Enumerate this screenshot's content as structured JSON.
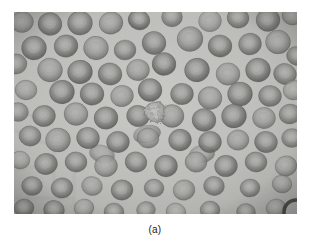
{
  "figure": {
    "caption": "(a)",
    "kind": "light-micrograph",
    "colors": {
      "page_background": "#ffffff",
      "field_background": "#b5b5b3",
      "field_background_light": "#c6c6c3",
      "field_background_dark": "#a3a3a1",
      "cell_rim": "#6d6d6b",
      "cell_rim_dark": "#4a4a48",
      "cell_center": "#9a9a98",
      "cell_center_light": "#adadaa",
      "anomalous_cell": "#b0b0ad",
      "caption_text": "#1a1a1a",
      "vignette_edge": "#8d8d8b"
    },
    "frame": {
      "x": 14,
      "y": 12,
      "width": 283,
      "height": 202
    },
    "render": {
      "view_width": 283,
      "view_height": 202,
      "grain_opacity": 0.26,
      "blur_px": 0.55
    },
    "cells": [
      {
        "cx": 8,
        "cy": 10,
        "r": 11.5,
        "tone": 0.78,
        "sq": 0.92,
        "rot": -8
      },
      {
        "cx": 36,
        "cy": 12,
        "r": 12.0,
        "tone": 0.84,
        "sq": 0.95,
        "rot": 12
      },
      {
        "cx": 66,
        "cy": 11,
        "r": 12.5,
        "tone": 0.8,
        "sq": 0.97,
        "rot": 4
      },
      {
        "cx": 97,
        "cy": 11,
        "r": 12.0,
        "tone": 0.86,
        "sq": 0.93,
        "rot": -16
      },
      {
        "cx": 125,
        "cy": 8,
        "r": 11.0,
        "tone": 0.9,
        "sq": 0.9,
        "rot": 20
      },
      {
        "cx": 158,
        "cy": 5,
        "r": 10.5,
        "tone": 0.74,
        "sq": 0.95,
        "rot": 0
      },
      {
        "cx": 196,
        "cy": 9,
        "r": 11.5,
        "tone": 0.7,
        "sq": 0.94,
        "rot": -6
      },
      {
        "cx": 224,
        "cy": 6,
        "r": 11.0,
        "tone": 0.78,
        "sq": 0.92,
        "rot": 10
      },
      {
        "cx": 254,
        "cy": 8,
        "r": 12.0,
        "tone": 0.82,
        "sq": 0.96,
        "rot": -4
      },
      {
        "cx": 278,
        "cy": 4,
        "r": 10.0,
        "tone": 0.72,
        "sq": 0.9,
        "rot": 16
      },
      {
        "cx": 20,
        "cy": 36,
        "r": 12.5,
        "tone": 0.88,
        "sq": 0.96,
        "rot": 6
      },
      {
        "cx": 52,
        "cy": 34,
        "r": 12.0,
        "tone": 0.84,
        "sq": 0.94,
        "rot": -12
      },
      {
        "cx": 82,
        "cy": 36,
        "r": 12.5,
        "tone": 0.86,
        "sq": 0.95,
        "rot": 8
      },
      {
        "cx": 111,
        "cy": 38,
        "r": 11.0,
        "tone": 0.76,
        "sq": 0.92,
        "rot": -3
      },
      {
        "cx": 140,
        "cy": 31,
        "r": 12.0,
        "tone": 0.82,
        "sq": 0.97,
        "rot": 14
      },
      {
        "cx": 176,
        "cy": 27,
        "r": 13.0,
        "tone": 0.9,
        "sq": 0.96,
        "rot": -9
      },
      {
        "cx": 206,
        "cy": 34,
        "r": 12.0,
        "tone": 0.86,
        "sq": 0.93,
        "rot": 5
      },
      {
        "cx": 236,
        "cy": 32,
        "r": 11.5,
        "tone": 0.8,
        "sq": 0.95,
        "rot": -14
      },
      {
        "cx": 264,
        "cy": 30,
        "r": 12.5,
        "tone": 0.88,
        "sq": 0.96,
        "rot": 2
      },
      {
        "cx": 283,
        "cy": 44,
        "r": 10.5,
        "tone": 0.74,
        "sq": 0.9,
        "rot": 18
      },
      {
        "cx": 2,
        "cy": 52,
        "r": 11.0,
        "tone": 0.7,
        "sq": 0.92,
        "rot": -5
      },
      {
        "cx": 36,
        "cy": 58,
        "r": 12.5,
        "tone": 0.86,
        "sq": 0.96,
        "rot": 9
      },
      {
        "cx": 66,
        "cy": 60,
        "r": 12.5,
        "tone": 0.88,
        "sq": 0.95,
        "rot": -7
      },
      {
        "cx": 96,
        "cy": 62,
        "r": 12.0,
        "tone": 0.82,
        "sq": 0.93,
        "rot": 13
      },
      {
        "cx": 124,
        "cy": 58,
        "r": 11.5,
        "tone": 0.84,
        "sq": 0.94,
        "rot": -2
      },
      {
        "cx": 150,
        "cy": 52,
        "r": 12.0,
        "tone": 0.9,
        "sq": 0.96,
        "rot": 7
      },
      {
        "cx": 183,
        "cy": 58,
        "r": 12.5,
        "tone": 0.86,
        "sq": 0.95,
        "rot": -11
      },
      {
        "cx": 214,
        "cy": 62,
        "r": 12.0,
        "tone": 0.8,
        "sq": 0.94,
        "rot": 3
      },
      {
        "cx": 244,
        "cy": 58,
        "r": 12.5,
        "tone": 0.88,
        "sq": 0.96,
        "rot": -6
      },
      {
        "cx": 271,
        "cy": 62,
        "r": 11.5,
        "tone": 0.78,
        "sq": 0.92,
        "rot": 15
      },
      {
        "cx": 12,
        "cy": 78,
        "r": 11.0,
        "tone": 0.72,
        "sq": 0.9,
        "rot": 4
      },
      {
        "cx": 48,
        "cy": 80,
        "r": 12.5,
        "tone": 0.86,
        "sq": 0.95,
        "rot": -10
      },
      {
        "cx": 78,
        "cy": 82,
        "r": 12.0,
        "tone": 0.84,
        "sq": 0.94,
        "rot": 6
      },
      {
        "cx": 108,
        "cy": 84,
        "r": 11.5,
        "tone": 0.8,
        "sq": 0.93,
        "rot": -13
      },
      {
        "cx": 136,
        "cy": 78,
        "r": 12.0,
        "tone": 0.88,
        "sq": 0.96,
        "rot": 8
      },
      {
        "cx": 168,
        "cy": 82,
        "r": 11.5,
        "tone": 0.82,
        "sq": 0.94,
        "rot": -4
      },
      {
        "cx": 196,
        "cy": 86,
        "r": 12.0,
        "tone": 0.86,
        "sq": 0.95,
        "rot": 11
      },
      {
        "cx": 226,
        "cy": 82,
        "r": 12.5,
        "tone": 0.84,
        "sq": 0.96,
        "rot": -8
      },
      {
        "cx": 256,
        "cy": 84,
        "r": 11.5,
        "tone": 0.78,
        "sq": 0.92,
        "rot": 5
      },
      {
        "cx": 280,
        "cy": 78,
        "r": 11.0,
        "tone": 0.74,
        "sq": 0.9,
        "rot": -15
      },
      {
        "cx": 4,
        "cy": 100,
        "r": 10.5,
        "tone": 0.68,
        "sq": 0.9,
        "rot": 2
      },
      {
        "cx": 30,
        "cy": 104,
        "r": 11.5,
        "tone": 0.8,
        "sq": 0.93,
        "rot": -7
      },
      {
        "cx": 62,
        "cy": 102,
        "r": 12.0,
        "tone": 0.84,
        "sq": 0.95,
        "rot": 10
      },
      {
        "cx": 92,
        "cy": 106,
        "r": 12.0,
        "tone": 0.86,
        "sq": 0.94,
        "rot": -5
      },
      {
        "cx": 124,
        "cy": 104,
        "r": 11.5,
        "tone": 0.82,
        "sq": 0.93,
        "rot": 14
      },
      {
        "cx": 158,
        "cy": 104,
        "r": 12.0,
        "tone": 0.88,
        "sq": 0.96,
        "rot": -3
      },
      {
        "cx": 190,
        "cy": 108,
        "r": 12.0,
        "tone": 0.84,
        "sq": 0.95,
        "rot": 7
      },
      {
        "cx": 220,
        "cy": 104,
        "r": 12.5,
        "tone": 0.86,
        "sq": 0.96,
        "rot": -12
      },
      {
        "cx": 250,
        "cy": 106,
        "r": 11.5,
        "tone": 0.8,
        "sq": 0.93,
        "rot": 4
      },
      {
        "cx": 276,
        "cy": 102,
        "r": 11.0,
        "tone": 0.76,
        "sq": 0.91,
        "rot": -9
      },
      {
        "cx": 16,
        "cy": 124,
        "r": 11.0,
        "tone": 0.76,
        "sq": 0.92,
        "rot": 6
      },
      {
        "cx": 44,
        "cy": 128,
        "r": 12.5,
        "tone": 0.88,
        "sq": 0.96,
        "rot": -8
      },
      {
        "cx": 74,
        "cy": 126,
        "r": 11.5,
        "tone": 0.82,
        "sq": 0.94,
        "rot": 12
      },
      {
        "cx": 104,
        "cy": 130,
        "r": 11.5,
        "tone": 0.84,
        "sq": 0.93,
        "rot": -4
      },
      {
        "cx": 134,
        "cy": 126,
        "r": 11.0,
        "tone": 0.8,
        "sq": 0.92,
        "rot": 9
      },
      {
        "cx": 166,
        "cy": 128,
        "r": 11.5,
        "tone": 0.86,
        "sq": 0.95,
        "rot": -13
      },
      {
        "cx": 196,
        "cy": 130,
        "r": 11.5,
        "tone": 0.84,
        "sq": 0.94,
        "rot": 3
      },
      {
        "cx": 224,
        "cy": 128,
        "r": 11.0,
        "tone": 0.8,
        "sq": 0.93,
        "rot": -6
      },
      {
        "cx": 252,
        "cy": 130,
        "r": 11.5,
        "tone": 0.82,
        "sq": 0.94,
        "rot": 11
      },
      {
        "cx": 278,
        "cy": 126,
        "r": 10.5,
        "tone": 0.74,
        "sq": 0.9,
        "rot": -2
      },
      {
        "cx": 6,
        "cy": 148,
        "r": 10.0,
        "tone": 0.7,
        "sq": 0.9,
        "rot": 8
      },
      {
        "cx": 32,
        "cy": 152,
        "r": 11.5,
        "tone": 0.82,
        "sq": 0.93,
        "rot": -11
      },
      {
        "cx": 62,
        "cy": 150,
        "r": 11.0,
        "tone": 0.78,
        "sq": 0.92,
        "rot": 5
      },
      {
        "cx": 92,
        "cy": 154,
        "r": 11.5,
        "tone": 0.84,
        "sq": 0.94,
        "rot": -7
      },
      {
        "cx": 122,
        "cy": 150,
        "r": 11.0,
        "tone": 0.8,
        "sq": 0.93,
        "rot": 13
      },
      {
        "cx": 152,
        "cy": 154,
        "r": 11.5,
        "tone": 0.86,
        "sq": 0.95,
        "rot": -3
      },
      {
        "cx": 182,
        "cy": 150,
        "r": 11.0,
        "tone": 0.82,
        "sq": 0.93,
        "rot": 7
      },
      {
        "cx": 212,
        "cy": 154,
        "r": 11.5,
        "tone": 0.84,
        "sq": 0.94,
        "rot": -10
      },
      {
        "cx": 242,
        "cy": 150,
        "r": 11.0,
        "tone": 0.78,
        "sq": 0.92,
        "rot": 4
      },
      {
        "cx": 272,
        "cy": 154,
        "r": 11.0,
        "tone": 0.8,
        "sq": 0.93,
        "rot": -14
      },
      {
        "cx": 18,
        "cy": 174,
        "r": 10.5,
        "tone": 0.76,
        "sq": 0.91,
        "rot": 3
      },
      {
        "cx": 48,
        "cy": 176,
        "r": 11.0,
        "tone": 0.8,
        "sq": 0.93,
        "rot": -9
      },
      {
        "cx": 78,
        "cy": 174,
        "r": 10.5,
        "tone": 0.76,
        "sq": 0.91,
        "rot": 12
      },
      {
        "cx": 108,
        "cy": 178,
        "r": 11.0,
        "tone": 0.82,
        "sq": 0.93,
        "rot": -5
      },
      {
        "cx": 140,
        "cy": 176,
        "r": 10.0,
        "tone": 0.74,
        "sq": 0.9,
        "rot": 8
      },
      {
        "cx": 170,
        "cy": 178,
        "r": 11.0,
        "tone": 0.82,
        "sq": 0.93,
        "rot": -12
      },
      {
        "cx": 200,
        "cy": 174,
        "r": 10.5,
        "tone": 0.78,
        "sq": 0.92,
        "rot": 6
      },
      {
        "cx": 236,
        "cy": 176,
        "r": 10.0,
        "tone": 0.76,
        "sq": 0.91,
        "rot": -4
      },
      {
        "cx": 268,
        "cy": 172,
        "r": 10.0,
        "tone": 0.72,
        "sq": 0.9,
        "rot": 10
      },
      {
        "cx": 10,
        "cy": 196,
        "r": 10.0,
        "tone": 0.72,
        "sq": 0.9,
        "rot": -6
      },
      {
        "cx": 40,
        "cy": 198,
        "r": 10.5,
        "tone": 0.78,
        "sq": 0.92,
        "rot": 9
      },
      {
        "cx": 70,
        "cy": 196,
        "r": 10.0,
        "tone": 0.74,
        "sq": 0.9,
        "rot": -11
      },
      {
        "cx": 100,
        "cy": 200,
        "r": 10.0,
        "tone": 0.76,
        "sq": 0.91,
        "rot": 5
      },
      {
        "cx": 132,
        "cy": 198,
        "r": 9.5,
        "tone": 0.7,
        "sq": 0.9,
        "rot": -8
      },
      {
        "cx": 162,
        "cy": 200,
        "r": 10.0,
        "tone": 0.74,
        "sq": 0.9,
        "rot": 13
      },
      {
        "cx": 196,
        "cy": 198,
        "r": 10.0,
        "tone": 0.76,
        "sq": 0.91,
        "rot": -3
      },
      {
        "cx": 232,
        "cy": 200,
        "r": 9.5,
        "tone": 0.7,
        "sq": 0.9,
        "rot": 7
      },
      {
        "cx": 262,
        "cy": 196,
        "r": 10.0,
        "tone": 0.72,
        "sq": 0.9,
        "rot": -10
      }
    ],
    "anomalous_cell": {
      "cx": 141,
      "cy": 100,
      "r": 11.0,
      "label": "crenated-cell"
    },
    "overlap_blobs": [
      {
        "cx": 133,
        "cy": 122,
        "rx": 14,
        "ry": 9,
        "rot": -12,
        "tone": 0.8
      },
      {
        "cx": 88,
        "cy": 142,
        "rx": 13,
        "ry": 9,
        "rot": 16,
        "tone": 0.78
      },
      {
        "cx": 188,
        "cy": 142,
        "rx": 13,
        "ry": 9,
        "rot": -8,
        "tone": 0.8
      }
    ],
    "mesh_lines": [
      {
        "x1": 0,
        "y1": 118,
        "x2": 42,
        "y2": 136
      },
      {
        "x1": 0,
        "y1": 158,
        "x2": 40,
        "y2": 152
      },
      {
        "x1": 14,
        "y1": 170,
        "x2": 14,
        "y2": 202
      },
      {
        "x1": 0,
        "y1": 186,
        "x2": 60,
        "y2": 186
      },
      {
        "x1": 40,
        "y1": 136,
        "x2": 40,
        "y2": 170
      },
      {
        "x1": 60,
        "y1": 160,
        "x2": 60,
        "y2": 202
      },
      {
        "x1": 0,
        "y1": 96,
        "x2": 26,
        "y2": 108
      }
    ],
    "dark_arc": {
      "cx": 282,
      "cy": 200,
      "r": 12
    }
  }
}
